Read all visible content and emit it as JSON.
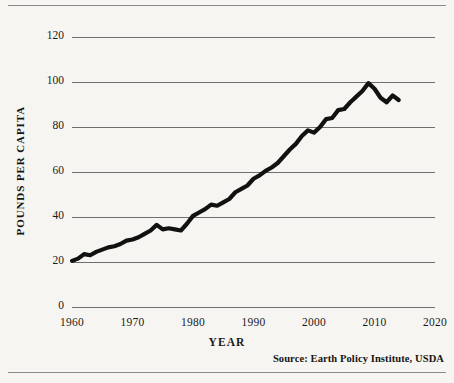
{
  "page": {
    "background_color": "#f7f5f1",
    "rules": [
      "top-rule",
      "bottom-rule"
    ]
  },
  "source_note": "Source: Earth Policy Institute, USDA",
  "chart_data": {
    "type": "line",
    "title": "",
    "subtitle": "",
    "xlabel": "YEAR",
    "ylabel": "POUNDS PER CAPITA",
    "xlim": [
      1960,
      2020
    ],
    "ylim": [
      0,
      120
    ],
    "xticks": [
      1960,
      1970,
      1980,
      1990,
      2000,
      2010,
      2020
    ],
    "xtick_labels": [
      "1960",
      "1970",
      "1980",
      "1990",
      "2000",
      "2010",
      "2020"
    ],
    "yticks": [
      0,
      20,
      40,
      60,
      80,
      100,
      120
    ],
    "ytick_labels": [
      "0",
      "20",
      "40",
      "60",
      "80",
      "100",
      "120"
    ],
    "grid": "horizontal",
    "legend": "none",
    "line_color": "#111111",
    "line_width": 4.2,
    "annotations": [
      "Source: Earth Policy Institute, USDA"
    ],
    "x": [
      1960,
      1961,
      1962,
      1963,
      1964,
      1965,
      1966,
      1967,
      1968,
      1969,
      1970,
      1971,
      1972,
      1973,
      1974,
      1975,
      1976,
      1977,
      1978,
      1979,
      1980,
      1981,
      1982,
      1983,
      1984,
      1985,
      1986,
      1987,
      1988,
      1989,
      1990,
      1991,
      1992,
      1993,
      1994,
      1995,
      1996,
      1997,
      1998,
      1999,
      2000,
      2001,
      2002,
      2003,
      2004,
      2005,
      2006,
      2007,
      2008,
      2009,
      2010,
      2011,
      2012,
      2013,
      2014
    ],
    "values": [
      20.5,
      21.5,
      23.5,
      23.0,
      24.5,
      25.5,
      26.5,
      27.0,
      28.0,
      29.5,
      30.0,
      31.0,
      32.5,
      34.0,
      36.5,
      34.5,
      35.0,
      34.5,
      34.0,
      37.0,
      40.5,
      42.0,
      43.5,
      45.5,
      45.0,
      46.5,
      48.0,
      51.0,
      52.5,
      54.0,
      57.0,
      58.5,
      60.5,
      62.0,
      64.0,
      67.0,
      70.0,
      72.5,
      76.0,
      78.5,
      77.5,
      80.0,
      83.5,
      84.0,
      87.5,
      88.0,
      91.0,
      93.5,
      96.0,
      99.5,
      97.0,
      93.0,
      91.0,
      94.0,
      92.0
    ]
  }
}
